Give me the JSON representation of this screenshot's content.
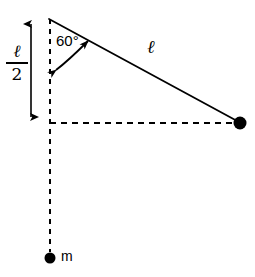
{
  "figure": {
    "type": "physics-geometry-diagram",
    "background_color": "#ffffff",
    "stroke_color": "#000000",
    "labels": {
      "half_length_numerator": "ℓ",
      "half_length_denominator": "2",
      "angle": "60°",
      "length": "ℓ",
      "mass": "m"
    },
    "geometry": {
      "pivot_point": {
        "x": 49,
        "y": 19
      },
      "bob_point": {
        "x": 240,
        "y": 123
      },
      "mass_point": {
        "x": 50,
        "y": 258
      },
      "vertical_axis_x": 50,
      "horizontal_dashed_y": 123,
      "dimension_line_x": 31,
      "dimension_top_y": 17,
      "dimension_bottom_y": 123,
      "angle_degrees": 60
    }
  }
}
